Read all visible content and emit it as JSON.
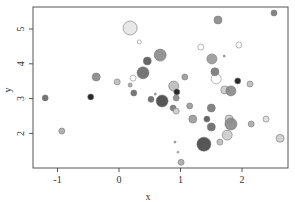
{
  "chart_data": {
    "type": "scatter",
    "title": "",
    "xlabel": "x",
    "ylabel": "y",
    "xlim": [
      -1.4,
      2.7
    ],
    "ylim": [
      1.0,
      5.6
    ],
    "xticks": [
      -1,
      0,
      1,
      2
    ],
    "yticks": [
      2,
      3,
      4,
      5
    ],
    "grid": false,
    "legend": null,
    "encoding": "bubble size and grayscale fill vary per point",
    "points": [
      {
        "x": 0.18,
        "y": 5.03,
        "r": 7,
        "fill": "#e6e6e6"
      },
      {
        "x": 0.33,
        "y": 4.63,
        "r": 2,
        "fill": "none"
      },
      {
        "x": 1.61,
        "y": 5.26,
        "r": 4,
        "fill": "#888888"
      },
      {
        "x": 2.52,
        "y": 5.46,
        "r": 3,
        "fill": "#777777"
      },
      {
        "x": 1.33,
        "y": 4.48,
        "r": 3,
        "fill": "none"
      },
      {
        "x": 1.95,
        "y": 4.54,
        "r": 3,
        "fill": "none"
      },
      {
        "x": 0.67,
        "y": 4.25,
        "r": 6,
        "fill": "#888888"
      },
      {
        "x": 0.46,
        "y": 4.08,
        "r": 4,
        "fill": "#555555"
      },
      {
        "x": 0.39,
        "y": 3.74,
        "r": 6,
        "fill": "#666666"
      },
      {
        "x": 0.23,
        "y": 3.59,
        "r": 3,
        "fill": "none"
      },
      {
        "x": -0.37,
        "y": 3.62,
        "r": 4,
        "fill": "#888888"
      },
      {
        "x": 1.07,
        "y": 3.62,
        "r": 3,
        "fill": "#999999"
      },
      {
        "x": 1.51,
        "y": 4.14,
        "r": 5,
        "fill": "#999999"
      },
      {
        "x": 1.71,
        "y": 4.22,
        "r": 1,
        "fill": "#999999"
      },
      {
        "x": 1.56,
        "y": 3.77,
        "r": 4,
        "fill": "#777777"
      },
      {
        "x": 1.58,
        "y": 3.57,
        "r": 5,
        "fill": "none"
      },
      {
        "x": 1.93,
        "y": 3.51,
        "r": 3,
        "fill": "#111111"
      },
      {
        "x": 1.72,
        "y": 3.25,
        "r": 4,
        "fill": "#cccccc"
      },
      {
        "x": 1.82,
        "y": 3.22,
        "r": 5,
        "fill": "#888888"
      },
      {
        "x": 2.13,
        "y": 3.42,
        "r": 3,
        "fill": "#bbbbbb"
      },
      {
        "x": -1.2,
        "y": 3.02,
        "r": 3,
        "fill": "#666666"
      },
      {
        "x": -0.46,
        "y": 3.05,
        "r": 3,
        "fill": "#111111"
      },
      {
        "x": 0.18,
        "y": 3.39,
        "r": 2,
        "fill": "#aaaaaa"
      },
      {
        "x": 0.24,
        "y": 3.16,
        "r": 3,
        "fill": "#666666"
      },
      {
        "x": -0.03,
        "y": 3.48,
        "r": 3,
        "fill": "#bbbbbb"
      },
      {
        "x": 0.59,
        "y": 3.13,
        "r": 1,
        "fill": "#999999"
      },
      {
        "x": 0.7,
        "y": 2.93,
        "r": 6,
        "fill": "#444444"
      },
      {
        "x": 0.52,
        "y": 2.98,
        "r": 3,
        "fill": "#666666"
      },
      {
        "x": 0.89,
        "y": 3.36,
        "r": 5,
        "fill": "#bbbbbb"
      },
      {
        "x": 0.94,
        "y": 3.19,
        "r": 3,
        "fill": "#111111"
      },
      {
        "x": 0.93,
        "y": 3.02,
        "r": 3,
        "fill": "#888888"
      },
      {
        "x": 0.88,
        "y": 2.73,
        "r": 3,
        "fill": "#777777"
      },
      {
        "x": 0.93,
        "y": 2.64,
        "r": 3,
        "fill": "#cccccc"
      },
      {
        "x": 1.15,
        "y": 2.79,
        "r": 3,
        "fill": "#999999"
      },
      {
        "x": -0.93,
        "y": 2.07,
        "r": 3,
        "fill": "#aaaaaa"
      },
      {
        "x": 1.5,
        "y": 2.73,
        "r": 4,
        "fill": "#777777"
      },
      {
        "x": 1.43,
        "y": 2.41,
        "r": 3,
        "fill": "#555555"
      },
      {
        "x": 1.2,
        "y": 2.41,
        "r": 4,
        "fill": "#999999"
      },
      {
        "x": 1.5,
        "y": 2.18,
        "r": 4,
        "fill": "#666666"
      },
      {
        "x": 1.79,
        "y": 2.41,
        "r": 4,
        "fill": "#cccccc"
      },
      {
        "x": 1.82,
        "y": 2.27,
        "r": 6,
        "fill": "#888888"
      },
      {
        "x": 2.15,
        "y": 2.27,
        "r": 3,
        "fill": "#aaaaaa"
      },
      {
        "x": 2.39,
        "y": 2.41,
        "r": 3,
        "fill": "#dddddd"
      },
      {
        "x": 0.91,
        "y": 1.75,
        "r": 1,
        "fill": "#999999"
      },
      {
        "x": 1.38,
        "y": 1.69,
        "r": 7,
        "fill": "#444444"
      },
      {
        "x": 1.64,
        "y": 1.75,
        "r": 3,
        "fill": "#bbbbbb"
      },
      {
        "x": 1.76,
        "y": 1.95,
        "r": 5,
        "fill": "#cccccc"
      },
      {
        "x": 2.62,
        "y": 1.86,
        "r": 4,
        "fill": "#cccccc"
      },
      {
        "x": 0.96,
        "y": 1.46,
        "r": 1,
        "fill": "#cccccc"
      },
      {
        "x": 1.01,
        "y": 1.17,
        "r": 3,
        "fill": "#aaaaaa"
      }
    ]
  },
  "axes": {
    "xlabel": "x",
    "ylabel": "y",
    "xtick_labels": [
      "-1",
      "0",
      "1",
      "2"
    ],
    "ytick_labels": [
      "2",
      "3",
      "4",
      "5"
    ]
  }
}
